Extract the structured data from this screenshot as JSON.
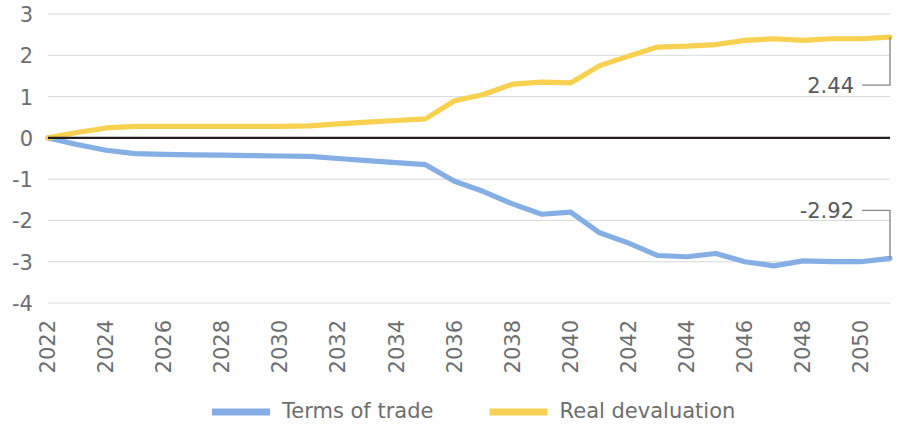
{
  "chart_data": {
    "type": "line",
    "title": "",
    "subtitle": "",
    "xlabel": "",
    "ylabel": "",
    "grid": true,
    "legend_position": "bottom",
    "xlim": [
      2022,
      2051
    ],
    "ylim": [
      -4,
      3
    ],
    "y_ticks": [
      3,
      2,
      1,
      0,
      -1,
      -2,
      -3,
      -4
    ],
    "x_ticks": [
      2022,
      2024,
      2026,
      2028,
      2030,
      2032,
      2034,
      2036,
      2038,
      2040,
      2042,
      2044,
      2046,
      2048,
      2050
    ],
    "x": [
      2022,
      2023,
      2024,
      2025,
      2026,
      2027,
      2028,
      2029,
      2030,
      2031,
      2032,
      2033,
      2034,
      2035,
      2036,
      2037,
      2038,
      2039,
      2040,
      2041,
      2042,
      2043,
      2044,
      2045,
      2046,
      2047,
      2048,
      2049,
      2050,
      2051
    ],
    "series": [
      {
        "name": "Terms of trade",
        "color": "#85AFE4",
        "values": [
          0,
          -0.16,
          -0.3,
          -0.38,
          -0.4,
          -0.41,
          -0.42,
          -0.43,
          -0.44,
          -0.45,
          -0.5,
          -0.55,
          -0.6,
          -0.65,
          -1.05,
          -1.3,
          -1.6,
          -1.85,
          -1.8,
          -2.3,
          -2.55,
          -2.85,
          -2.88,
          -2.8,
          -3.0,
          -3.1,
          -2.98,
          -3.0,
          -3.0,
          -2.92
        ]
      },
      {
        "name": "Real devaluation",
        "color": "#F7D14F",
        "values": [
          0,
          0.13,
          0.24,
          0.28,
          0.28,
          0.28,
          0.28,
          0.28,
          0.28,
          0.29,
          0.34,
          0.38,
          0.42,
          0.46,
          0.9,
          1.05,
          1.3,
          1.35,
          1.33,
          1.75,
          1.98,
          2.2,
          2.22,
          2.26,
          2.36,
          2.4,
          2.36,
          2.4,
          2.4,
          2.44
        ]
      }
    ],
    "annotations": [
      {
        "label": "2.44",
        "series": "Real devaluation",
        "value": 2.44,
        "at_x": 2051
      },
      {
        "label": "-2.92",
        "series": "Terms of trade",
        "value": -2.92,
        "at_x": 2051
      }
    ],
    "legend": [
      {
        "label": "Terms of trade",
        "color": "#85AFE4"
      },
      {
        "label": "Real devaluation",
        "color": "#F7D14F"
      }
    ]
  }
}
